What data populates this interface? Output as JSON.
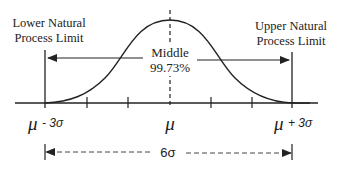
{
  "labels": {
    "lower_limit_line1": "Lower Natural",
    "lower_limit_line2": "Process Limit",
    "upper_limit_line1": "Upper Natural",
    "upper_limit_line2": "Process Limit",
    "middle_line1": "Middle",
    "middle_line2": "99.73%",
    "mu_minus": "μ",
    "mu_minus_suffix": "- 3σ",
    "mu_center": "μ",
    "mu_plus": "μ",
    "mu_plus_suffix": "+ 3σ",
    "six_sigma": "6σ"
  },
  "colors": {
    "line": "#222222",
    "background": "#ffffff"
  },
  "diagram": {
    "type": "normal-distribution",
    "tick_positions_sigma": [
      -3,
      -2,
      -1,
      0,
      1,
      2,
      3
    ],
    "coverage_percent": 99.73
  }
}
